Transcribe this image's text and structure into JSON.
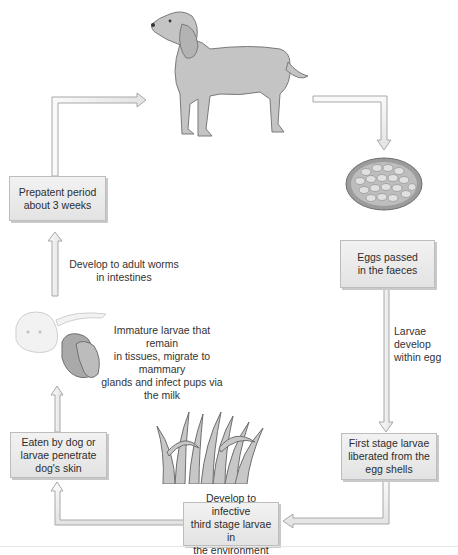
{
  "diagram": {
    "title": "",
    "type": "life-cycle",
    "subject": "dog",
    "nodes": [
      {
        "id": "dog",
        "kind": "illustration",
        "icon": "adult-dog-icon"
      },
      {
        "id": "egg",
        "kind": "illustration",
        "icon": "egg-icon"
      },
      {
        "id": "eggs_passed",
        "kind": "box",
        "lines": [
          "Eggs passed",
          "in the faeces"
        ]
      },
      {
        "id": "first_stage",
        "kind": "box",
        "lines": [
          "First stage larvae",
          "liberated from the",
          "egg shells"
        ]
      },
      {
        "id": "infective",
        "kind": "box",
        "lines": [
          "Develop to infective",
          "third stage larvae in",
          "the environment"
        ]
      },
      {
        "id": "grass",
        "kind": "illustration",
        "icon": "grass-icon"
      },
      {
        "id": "eaten",
        "kind": "box",
        "lines": [
          "Eaten by dog or",
          "larvae penetrate",
          "dog's skin"
        ]
      },
      {
        "id": "bitch_pups",
        "kind": "illustration",
        "icon": "dog-with-pups-icon"
      },
      {
        "id": "prepatent",
        "kind": "box",
        "lines": [
          "Prepatent period",
          "about 3 weeks"
        ]
      }
    ],
    "annotations": [
      {
        "id": "larvae_develop",
        "lines": [
          "Larvae develop",
          "within egg"
        ]
      },
      {
        "id": "immature_larvae",
        "lines": [
          "Immature larvae that remain",
          "in tissues, migrate to mammary",
          "glands and infect pups via",
          "the milk"
        ]
      },
      {
        "id": "adult_worms",
        "lines": [
          "Develop to adult worms",
          "in intestines"
        ]
      }
    ],
    "edges": [
      {
        "from": "dog",
        "to": "egg"
      },
      {
        "from": "egg",
        "to": "eggs_passed"
      },
      {
        "from": "eggs_passed",
        "to": "first_stage",
        "label": "larvae_develop"
      },
      {
        "from": "first_stage",
        "to": "infective"
      },
      {
        "from": "infective",
        "to": "eaten"
      },
      {
        "from": "eaten",
        "to": "prepatent",
        "label": "adult_worms"
      },
      {
        "from": "prepatent",
        "to": "dog"
      }
    ],
    "colors": {
      "arrow_fill": "#f4f4f4",
      "arrow_stroke": "#a8a8a8",
      "box_fill": "#e9e9e9",
      "box_border": "#bdbdbd",
      "illustration_gray": "#bdbdbd"
    }
  }
}
